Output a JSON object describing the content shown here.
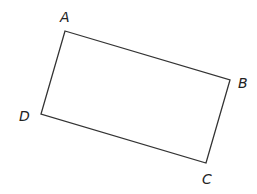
{
  "diagram": {
    "type": "rectangle",
    "stroke_color": "#333333",
    "stroke_width": 1.3,
    "background": "#ffffff",
    "vertices": [
      {
        "name": "A",
        "x": 65,
        "y": 31,
        "label": "A",
        "label_x": 60,
        "label_y": 22
      },
      {
        "name": "B",
        "x": 230,
        "y": 80,
        "label": "B",
        "label_x": 238,
        "label_y": 88
      },
      {
        "name": "C",
        "x": 206,
        "y": 163,
        "label": "C",
        "label_x": 202,
        "label_y": 184
      },
      {
        "name": "D",
        "x": 41,
        "y": 114,
        "label": "D",
        "label_x": 19,
        "label_y": 121
      }
    ],
    "edges": [
      {
        "from": "A",
        "to": "B"
      },
      {
        "from": "B",
        "to": "C"
      },
      {
        "from": "C",
        "to": "D"
      },
      {
        "from": "D",
        "to": "A"
      }
    ]
  }
}
